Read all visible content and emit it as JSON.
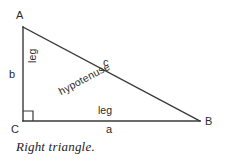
{
  "figure": {
    "caption": "Right triangle.",
    "title": "Right triangle",
    "background_color": "#ffffff",
    "line_color": "#3a3a3a",
    "text_color": "#2b2b2b"
  },
  "vertices": [
    {
      "id": "A",
      "label": "A",
      "x": 23,
      "y": 27
    },
    {
      "id": "B",
      "label": "B",
      "x": 200,
      "y": 121
    },
    {
      "id": "C",
      "label": "C",
      "x": 23,
      "y": 121
    }
  ],
  "right_angle": {
    "at_vertex": "C",
    "marker": "square",
    "size": 10
  },
  "sides": [
    {
      "id": "leg-vertical",
      "from": "C",
      "to": "A",
      "variable": "b",
      "word": "leg",
      "orientation": "vertical"
    },
    {
      "id": "leg-horizontal",
      "from": "C",
      "to": "B",
      "variable": "a",
      "word": "leg",
      "orientation": "horizontal"
    },
    {
      "id": "hypotenuse",
      "from": "A",
      "to": "B",
      "variable": "c",
      "word": "hypotenuse",
      "orientation": "diagonal"
    }
  ]
}
